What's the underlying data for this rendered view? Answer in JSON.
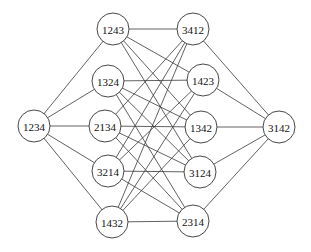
{
  "diagram": {
    "type": "graph",
    "node_radius": 16,
    "nodes": [
      {
        "id": "1234",
        "label": "1234",
        "x": 34,
        "y": 126
      },
      {
        "id": "1243",
        "label": "1243",
        "x": 113,
        "y": 29
      },
      {
        "id": "1324",
        "label": "1324",
        "x": 108,
        "y": 81
      },
      {
        "id": "2134",
        "label": "2134",
        "x": 105,
        "y": 126
      },
      {
        "id": "3214",
        "label": "3214",
        "x": 108,
        "y": 171
      },
      {
        "id": "1432",
        "label": "1432",
        "x": 112,
        "y": 222
      },
      {
        "id": "3412",
        "label": "3412",
        "x": 193,
        "y": 29
      },
      {
        "id": "1423",
        "label": "1423",
        "x": 203,
        "y": 80
      },
      {
        "id": "1342",
        "label": "1342",
        "x": 201,
        "y": 127
      },
      {
        "id": "3124",
        "label": "3124",
        "x": 200,
        "y": 172
      },
      {
        "id": "2314",
        "label": "2314",
        "x": 193,
        "y": 221
      },
      {
        "id": "3142",
        "label": "3142",
        "x": 279,
        "y": 127
      }
    ],
    "edges": [
      [
        "1234",
        "1243"
      ],
      [
        "1234",
        "1324"
      ],
      [
        "1234",
        "2134"
      ],
      [
        "1234",
        "3214"
      ],
      [
        "1234",
        "1432"
      ],
      [
        "1243",
        "3412"
      ],
      [
        "1243",
        "1423"
      ],
      [
        "1243",
        "1342"
      ],
      [
        "1243",
        "3124"
      ],
      [
        "1324",
        "1423"
      ],
      [
        "1324",
        "1342"
      ],
      [
        "1324",
        "3124"
      ],
      [
        "1324",
        "2314"
      ],
      [
        "2134",
        "3412"
      ],
      [
        "2134",
        "1342"
      ],
      [
        "2134",
        "3124"
      ],
      [
        "2134",
        "2314"
      ],
      [
        "3214",
        "3412"
      ],
      [
        "3214",
        "1423"
      ],
      [
        "3214",
        "3124"
      ],
      [
        "3214",
        "2314"
      ],
      [
        "1432",
        "3412"
      ],
      [
        "1432",
        "1423"
      ],
      [
        "1432",
        "1342"
      ],
      [
        "1432",
        "2314"
      ],
      [
        "3412",
        "3142"
      ],
      [
        "1423",
        "3142"
      ],
      [
        "1342",
        "3142"
      ],
      [
        "3124",
        "3142"
      ],
      [
        "2314",
        "3142"
      ]
    ]
  }
}
